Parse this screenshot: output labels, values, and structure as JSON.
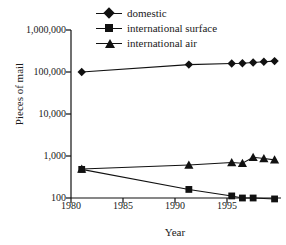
{
  "chart_data": {
    "type": "line",
    "title": "",
    "xlabel": "Year",
    "ylabel": "Pieces of mail",
    "yscale": "log",
    "ylim": [
      100,
      1000000
    ],
    "xlim": [
      1979,
      1998.6
    ],
    "grid": false,
    "legend_position": "top-center",
    "ytick_labels": [
      "1,000,000",
      "100,000",
      "10,000",
      "1,000",
      "100"
    ],
    "ytick_values": [
      1000000,
      100000,
      10000,
      1000,
      100
    ],
    "xtick_labels": [
      "1980",
      "1985",
      "1990",
      "1995"
    ],
    "xtick_values": [
      1980,
      1985,
      1990,
      1995
    ],
    "series": [
      {
        "name": "domestic",
        "marker": "diamond",
        "x": [
          1980,
          1990,
          1994,
          1995,
          1996,
          1997,
          1998
        ],
        "values": [
          100000,
          150000,
          160000,
          162000,
          168000,
          175000,
          182000
        ]
      },
      {
        "name": "international surface",
        "marker": "square",
        "x": [
          1980,
          1990,
          1994,
          1995,
          1996,
          1998
        ],
        "values": [
          480,
          160,
          112,
          100,
          100,
          95
        ]
      },
      {
        "name": "international air",
        "marker": "triangle",
        "x": [
          1980,
          1990,
          1994,
          1995,
          1996,
          1997,
          1998
        ],
        "values": [
          490,
          610,
          700,
          670,
          930,
          870,
          810
        ]
      }
    ]
  },
  "axes": {
    "ylabel": "Pieces of mail",
    "xlabel": "Year"
  }
}
